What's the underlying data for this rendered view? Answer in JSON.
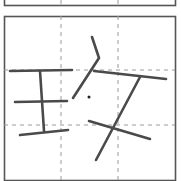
{
  "character": "玫",
  "grid": {
    "type": "practice-grid",
    "border_color": "#555555",
    "guide_color": "#9a9a9a",
    "stroke_color": "#4a4a4a",
    "prev_cell": {
      "x": 4,
      "y": -40,
      "w": 171,
      "h": 45,
      "guides_x": [
        61,
        118
      ]
    },
    "cell": {
      "x": 4,
      "y": 16,
      "w": 171,
      "h": 164,
      "guides_x": [
        61,
        118
      ],
      "guides_y": [
        70,
        125
      ]
    }
  },
  "strokes": [
    {
      "component": "王",
      "name": "top-horizontal",
      "points": [
        [
          10,
          71
        ],
        [
          72,
          70
        ]
      ]
    },
    {
      "component": "王",
      "name": "vertical",
      "points": [
        [
          40,
          71
        ],
        [
          44,
          131
        ]
      ]
    },
    {
      "component": "王",
      "name": "middle-horizontal",
      "points": [
        [
          15,
          102
        ],
        [
          67,
          101
        ]
      ]
    },
    {
      "component": "王",
      "name": "bottom-rising",
      "points": [
        [
          20,
          135
        ],
        [
          68,
          130
        ]
      ]
    },
    {
      "component": "攵",
      "name": "short-left-falling",
      "points": [
        [
          92,
          37
        ],
        [
          99,
          58
        ],
        [
          73,
          98
        ]
      ]
    },
    {
      "component": "攵",
      "name": "horizontal",
      "points": [
        [
          94,
          71
        ],
        [
          166,
          79
        ]
      ]
    },
    {
      "component": "攵",
      "name": "long-left-falling",
      "points": [
        [
          140,
          77
        ],
        [
          96,
          160
        ]
      ]
    },
    {
      "component": "攵",
      "name": "right-falling",
      "points": [
        [
          89,
          121
        ],
        [
          150,
          139
        ]
      ]
    }
  ],
  "dot": {
    "cx": 89,
    "cy": 97,
    "r": 1.5
  }
}
